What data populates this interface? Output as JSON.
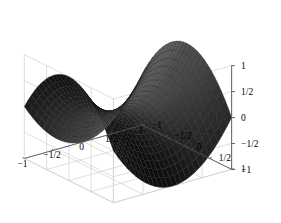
{
  "figure": {
    "kind": "surface-plot-3d",
    "background_color": "#ffffff",
    "frame_color": "#c9c9c9",
    "axis_color": "#555555",
    "label_color": "#000000",
    "surface_light_color": "#8a8a8a",
    "surface_dark_color": "#070707",
    "mesh_line_color": "#1a1a1a"
  },
  "chart_data": {
    "type": "surface",
    "title": "",
    "xlabel": "",
    "ylabel": "",
    "zlabel": "",
    "grid": true,
    "legend": "none",
    "function": "z = x^2 - y^2",
    "xlim": [
      -1,
      1
    ],
    "ylim": [
      -1,
      1
    ],
    "zlim": [
      -1,
      1
    ],
    "samples": 26,
    "x_ticks": [
      {
        "value": -1,
        "label": "-1"
      },
      {
        "value": -0.5,
        "label": "-1/2"
      },
      {
        "value": 0,
        "label": "0"
      },
      {
        "value": 0.5,
        "label": "1/2"
      },
      {
        "value": 1,
        "label": "1"
      }
    ],
    "y_ticks": [
      {
        "value": -1,
        "label": "-1"
      },
      {
        "value": -0.5,
        "label": "-1/2"
      },
      {
        "value": 0,
        "label": "0"
      },
      {
        "value": 0.5,
        "label": "1/2"
      },
      {
        "value": 1,
        "label": "1"
      }
    ],
    "z_ticks": [
      {
        "value": -1,
        "label": "-1"
      },
      {
        "value": -0.5,
        "label": "-1/2"
      },
      {
        "value": 0,
        "label": "0"
      },
      {
        "value": 0.5,
        "label": "1/2"
      },
      {
        "value": 1,
        "label": "1"
      }
    ],
    "view": {
      "azimuth_deg": 37,
      "elevation_deg": 22,
      "scale": 74,
      "origin_px": [
        128,
        112
      ],
      "z_scale": 56
    },
    "corner_values": [
      {
        "x": -1,
        "y": -1,
        "z": 0
      },
      {
        "x": -1,
        "y": 1,
        "z": 0
      },
      {
        "x": 1,
        "y": -1,
        "z": 0
      },
      {
        "x": 1,
        "y": 1,
        "z": 0
      },
      {
        "x": 0,
        "y": 0,
        "z": 0
      },
      {
        "x": -1,
        "y": 0,
        "z": 1
      },
      {
        "x": 1,
        "y": 0,
        "z": 1
      },
      {
        "x": 0,
        "y": -1,
        "z": -1
      },
      {
        "x": 0,
        "y": 1,
        "z": -1
      }
    ]
  }
}
